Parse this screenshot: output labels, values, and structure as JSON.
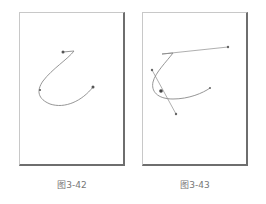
{
  "figures": [
    {
      "id": "left",
      "caption": "图3-42",
      "description": "Bezier path with anchor points, no handles shown"
    },
    {
      "id": "right",
      "caption": "图3-43",
      "description": "Bezier path with selected anchor showing direction handles"
    }
  ],
  "colors": {
    "curve": "#8a8a8a",
    "handle": "#9a9a9a",
    "anchor": "#555555",
    "frame_shadow": "#6e6e6e",
    "caption": "#777777"
  }
}
